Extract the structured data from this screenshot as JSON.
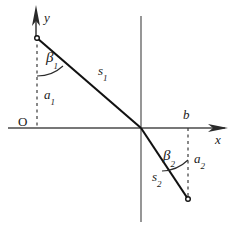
{
  "figure": {
    "type": "geometry-diagram",
    "background_color": "#ffffff",
    "stroke_color": "#3a3a3a",
    "line_color": "#1a1a1a",
    "text_color": "#1a1a1a"
  },
  "axes": {
    "y_axis": {
      "label": "y",
      "arrow": "up",
      "x": 35,
      "y_top": 8,
      "y_bottom": 40
    },
    "x_axis": {
      "label": "x",
      "arrow": "right",
      "y": 128,
      "x_left": 8,
      "x_right": 228
    },
    "vertical_center_line": {
      "x": 141,
      "y_top": 16,
      "y_bottom": 222
    },
    "origin_label": "O"
  },
  "points": {
    "upper": {
      "x": 37,
      "y": 38,
      "marker": "open-circle"
    },
    "crossing": {
      "x": 141,
      "y": 128
    },
    "lower": {
      "x": 188,
      "y": 199,
      "marker": "open-circle"
    }
  },
  "segments": {
    "s1": {
      "label": "s",
      "subscript": "1",
      "from": [
        37,
        38
      ],
      "to": [
        141,
        128
      ]
    },
    "s2": {
      "label": "s",
      "subscript": "2",
      "from": [
        141,
        128
      ],
      "to": [
        188,
        199
      ]
    }
  },
  "dashed_lines": {
    "a1": {
      "x": 37,
      "y_top": 38,
      "y_bottom": 128
    },
    "a2": {
      "x": 188,
      "y_top": 128,
      "y_bottom": 199
    }
  },
  "labels": [
    {
      "name": "y-axis-label",
      "text": "y",
      "sub": "",
      "x": 44,
      "y": 11,
      "style": "lbl-axis"
    },
    {
      "name": "x-axis-label",
      "text": "x",
      "sub": "",
      "x": 215,
      "y": 133,
      "style": "lbl-axis"
    },
    {
      "name": "origin-label",
      "text": "O",
      "sub": "",
      "x": 18,
      "y": 115,
      "style": "lbl-origin"
    },
    {
      "name": "beta1-label",
      "text": "β",
      "sub": "1",
      "x": 46,
      "y": 50,
      "style": "lbl-greek"
    },
    {
      "name": "a1-label",
      "text": "a",
      "sub": "1",
      "x": 44,
      "y": 88,
      "style": "lbl-var"
    },
    {
      "name": "s1-label",
      "text": "s",
      "sub": "1",
      "x": 98,
      "y": 64,
      "style": "lbl-var"
    },
    {
      "name": "b-label",
      "text": "b",
      "sub": "",
      "x": 183,
      "y": 108,
      "style": "lbl-var"
    },
    {
      "name": "beta2-label",
      "text": "β",
      "sub": "2",
      "x": 163,
      "y": 148,
      "style": "lbl-greek"
    },
    {
      "name": "a2-label",
      "text": "a",
      "sub": "2",
      "x": 194,
      "y": 152,
      "style": "lbl-var"
    },
    {
      "name": "s2-label",
      "text": "s",
      "sub": "2",
      "x": 152,
      "y": 170,
      "style": "lbl-var"
    }
  ],
  "angle_arcs": {
    "beta1": {
      "center": [
        37,
        38
      ],
      "radius": 36,
      "from_deg": 90,
      "to_deg": 49
    },
    "beta2": {
      "center": [
        188,
        199
      ],
      "radius": 38,
      "from_deg": 270,
      "to_deg": 214
    }
  }
}
